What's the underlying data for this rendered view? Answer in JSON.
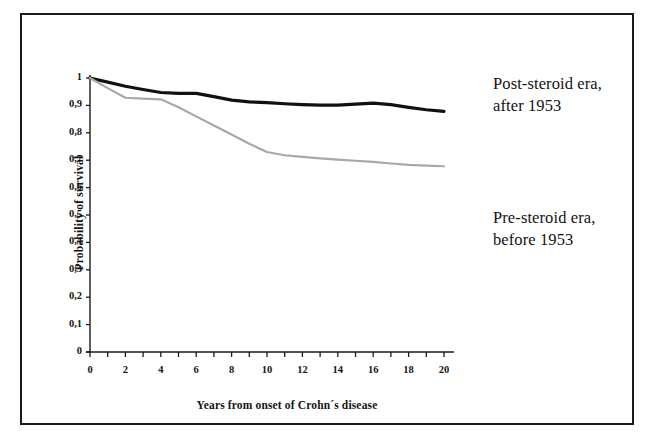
{
  "figure": {
    "background_color": "#ffffff",
    "border_color": "#1a1a1a"
  },
  "legend": {
    "post_steroid": {
      "line1": "Post-steroid era,",
      "line2": "after 1953"
    },
    "pre_steroid": {
      "line1": "Pre-steroid era,",
      "line2": "before 1953"
    }
  },
  "chart_data": {
    "type": "line",
    "title": "",
    "subtitle": "",
    "xlabel": "Years from onset of Crohn´s disease",
    "ylabel": "Probability of survival",
    "xlim": [
      0,
      20
    ],
    "ylim": [
      0,
      1
    ],
    "grid": false,
    "legend_position": "right",
    "xticks": [
      0,
      2,
      4,
      6,
      8,
      10,
      12,
      14,
      16,
      18,
      20
    ],
    "xtick_labels": [
      "0",
      "2",
      "4",
      "6",
      "8",
      "10",
      "12",
      "14",
      "16",
      "18",
      "20"
    ],
    "xminor_tick_step": 1,
    "yticks": [
      0,
      0.1,
      0.2,
      0.3,
      0.4,
      0.5,
      0.6,
      0.7,
      0.8,
      0.9,
      1
    ],
    "ytick_labels": [
      "0",
      "0,1",
      "0,2",
      "0,3",
      "0,4",
      "0,5",
      "0,6",
      "0,7",
      "0,8",
      "0,9",
      "1"
    ],
    "x": [
      0,
      1,
      2,
      3,
      4,
      5,
      6,
      7,
      8,
      9,
      10,
      11,
      12,
      13,
      14,
      15,
      16,
      17,
      18,
      19,
      20
    ],
    "series": [
      {
        "name": "Post-steroid era, after 1953",
        "color": "#111111",
        "line_width": 3.2,
        "values": [
          1.0,
          0.985,
          0.97,
          0.958,
          0.947,
          0.944,
          0.944,
          0.932,
          0.919,
          0.913,
          0.91,
          0.906,
          0.903,
          0.901,
          0.901,
          0.905,
          0.908,
          0.903,
          0.893,
          0.884,
          0.878
        ]
      },
      {
        "name": "Pre-steroid era, before 1953",
        "color": "#a8a8a8",
        "line_width": 2.2,
        "values": [
          1.0,
          0.963,
          0.928,
          0.925,
          0.922,
          0.893,
          0.86,
          0.827,
          0.794,
          0.76,
          0.73,
          0.718,
          0.712,
          0.707,
          0.702,
          0.698,
          0.694,
          0.688,
          0.683,
          0.68,
          0.678
        ]
      }
    ]
  }
}
